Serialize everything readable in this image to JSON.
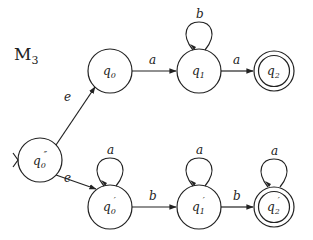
{
  "diagram": {
    "title": "M",
    "title_sub": "3",
    "states": [
      {
        "id": "q0pp",
        "name": "q",
        "sub": "0",
        "prime": "″",
        "accept": false,
        "start": true
      },
      {
        "id": "q0",
        "name": "q",
        "sub": "0",
        "prime": "",
        "accept": false,
        "start": false
      },
      {
        "id": "q1",
        "name": "q",
        "sub": "1",
        "prime": "",
        "accept": false,
        "start": false
      },
      {
        "id": "q2",
        "name": "q",
        "sub": "2",
        "prime": "",
        "accept": true,
        "start": false
      },
      {
        "id": "q0p",
        "name": "q",
        "sub": "0",
        "prime": "′",
        "accept": false,
        "start": false
      },
      {
        "id": "q1p",
        "name": "q",
        "sub": "1",
        "prime": "′",
        "accept": false,
        "start": false
      },
      {
        "id": "q2p",
        "name": "q",
        "sub": "2",
        "prime": "′",
        "accept": true,
        "start": false
      }
    ],
    "transitions": [
      {
        "from": "q0pp",
        "to": "q0",
        "label": "e"
      },
      {
        "from": "q0pp",
        "to": "q0p",
        "label": "e"
      },
      {
        "from": "q0",
        "to": "q1",
        "label": "a"
      },
      {
        "from": "q1",
        "to": "q1",
        "label": "b"
      },
      {
        "from": "q1",
        "to": "q2",
        "label": "a"
      },
      {
        "from": "q0p",
        "to": "q0p",
        "label": "a"
      },
      {
        "from": "q0p",
        "to": "q1p",
        "label": "b"
      },
      {
        "from": "q1p",
        "to": "q1p",
        "label": "a"
      },
      {
        "from": "q1p",
        "to": "q2p",
        "label": "b"
      },
      {
        "from": "q2p",
        "to": "q2p",
        "label": "a"
      }
    ]
  }
}
